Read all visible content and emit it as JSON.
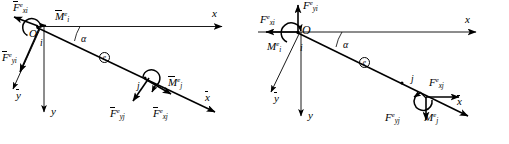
{
  "figure": {
    "background_color": "#ffffff",
    "line_color": "#000000",
    "panel_count": 2
  },
  "panels": [
    {
      "id": "local",
      "name": "local-coordinate-diagram",
      "description": "Beam element e with nodal forces expressed in the local (barred) coordinate system",
      "origin_label": "O",
      "element_marker": "e",
      "angle_label": "α",
      "nodes": [
        {
          "id": "i",
          "label": "i"
        },
        {
          "id": "j",
          "label": "j"
        }
      ],
      "axes": [
        {
          "name": "global-x-axis",
          "base": "x",
          "overline": false,
          "direction": "right"
        },
        {
          "name": "global-y-axis",
          "base": "y",
          "overline": false,
          "direction": "down"
        },
        {
          "name": "local-x-axis",
          "base": "x",
          "overline": true,
          "direction": "down-right"
        },
        {
          "name": "local-y-axis",
          "base": "y",
          "overline": true,
          "direction": "down-left"
        }
      ],
      "loads": [
        {
          "name": "force-xi",
          "base": "F",
          "sup": "e",
          "sub": "xi",
          "overline": true,
          "kind": "force",
          "direction": "up-left"
        },
        {
          "name": "force-yi",
          "base": "F",
          "sup": "e",
          "sub": "yi",
          "overline": true,
          "kind": "force",
          "direction": "down-left"
        },
        {
          "name": "moment-i",
          "base": "M",
          "sup": "e",
          "sub": "i",
          "overline": true,
          "kind": "moment",
          "direction": "counter-clockwise"
        },
        {
          "name": "force-xj",
          "base": "F",
          "sup": "e",
          "sub": "xj",
          "overline": true,
          "kind": "force",
          "direction": "down-right"
        },
        {
          "name": "force-yj",
          "base": "F",
          "sup": "e",
          "sub": "yj",
          "overline": true,
          "kind": "force",
          "direction": "down-left"
        },
        {
          "name": "moment-j",
          "base": "M",
          "sup": "e",
          "sub": "j",
          "overline": true,
          "kind": "moment",
          "direction": "counter-clockwise"
        }
      ]
    },
    {
      "id": "global",
      "name": "global-coordinate-diagram",
      "description": "Beam element e with nodal forces expressed in the global (unbarred) coordinate system",
      "origin_label": "O",
      "element_marker": "e",
      "angle_label": "α",
      "nodes": [
        {
          "id": "i",
          "label": "i"
        },
        {
          "id": "j",
          "label": "j"
        }
      ],
      "axes": [
        {
          "name": "global-x-axis",
          "base": "x",
          "overline": false,
          "direction": "right"
        },
        {
          "name": "global-y-axis",
          "base": "y",
          "overline": false,
          "direction": "down"
        },
        {
          "name": "local-x-axis",
          "base": "x",
          "overline": true,
          "direction": "down-right"
        },
        {
          "name": "local-y-axis",
          "base": "y",
          "overline": true,
          "direction": "down-left"
        }
      ],
      "loads": [
        {
          "name": "force-xi",
          "base": "F",
          "sup": "e",
          "sub": "xi",
          "overline": false,
          "kind": "force",
          "direction": "left"
        },
        {
          "name": "force-yi",
          "base": "F",
          "sup": "e",
          "sub": "yi",
          "overline": false,
          "kind": "force",
          "direction": "up"
        },
        {
          "name": "moment-i",
          "base": "M",
          "sup": "e",
          "sub": "i",
          "overline": false,
          "kind": "moment",
          "direction": "counter-clockwise"
        },
        {
          "name": "force-xj",
          "base": "F",
          "sup": "e",
          "sub": "xj",
          "overline": false,
          "kind": "force",
          "direction": "right"
        },
        {
          "name": "force-yj",
          "base": "F",
          "sup": "e",
          "sub": "yj",
          "overline": false,
          "kind": "force",
          "direction": "down"
        },
        {
          "name": "moment-j",
          "base": "M",
          "sup": "e",
          "sub": "j",
          "overline": false,
          "kind": "moment",
          "direction": "counter-clockwise"
        }
      ]
    }
  ]
}
